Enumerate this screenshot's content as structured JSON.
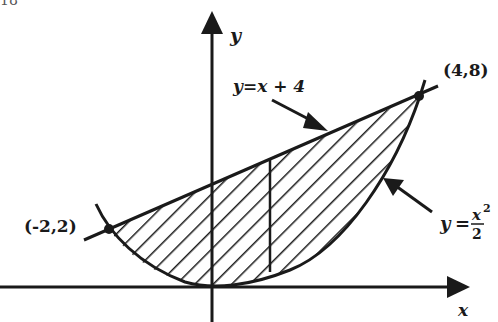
{
  "page_number_fragment": "18",
  "axes": {
    "x_label": "x",
    "y_label": "y"
  },
  "points": {
    "left": "(-2,2)",
    "right": "(4,8)"
  },
  "curves": {
    "line_label": "y = x + 4",
    "line_label_parts": {
      "lhs": "y",
      "eq": "=",
      "rhs": "x + 4"
    },
    "parabola_label_parts": {
      "lhs": "y",
      "eq": "=",
      "num": "x",
      "exp": "2",
      "den": "2"
    }
  },
  "colors": {
    "ink": "#1a1a1a",
    "background": "#ffffff"
  }
}
